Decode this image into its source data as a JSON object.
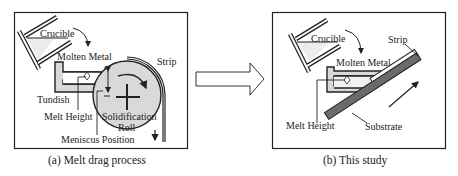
{
  "figure": {
    "panel_a": {
      "caption": "(a) Melt drag process",
      "labels": {
        "crucible": "Crucible",
        "molten_metal": "Molten Metal",
        "strip": "Strip",
        "tundish": "Tundish",
        "melt_height": "Melt Height",
        "solidification_roll_1": "Solidification",
        "solidification_roll_2": "Roll",
        "meniscus_position": "Meniscus Position"
      }
    },
    "panel_b": {
      "caption": "(b) This study",
      "labels": {
        "crucible": "Crucible",
        "molten_metal": "Molten Metal",
        "strip": "Strip",
        "melt_height": "Melt Height",
        "substrate": "Substrate"
      }
    },
    "transition_arrow": "right-arrow-icon",
    "colors": {
      "line": "#222222",
      "fill_light": "#d9d9d9",
      "substrate": "#6b6b6b"
    }
  }
}
